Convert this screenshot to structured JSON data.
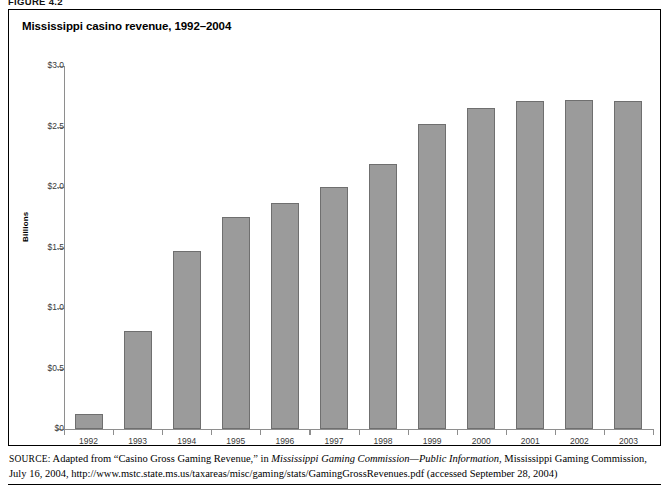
{
  "figure": {
    "label": "FIGURE 4.2"
  },
  "chart_data": {
    "type": "bar",
    "title": "Mississippi casino revenue, 1992–2004",
    "xlabel": "",
    "ylabel": "Billions",
    "categories": [
      "1992",
      "1993",
      "1994",
      "1995",
      "1996",
      "1997",
      "1998",
      "1999",
      "2000",
      "2001",
      "2002",
      "2003"
    ],
    "values": [
      0.12,
      0.81,
      1.47,
      1.75,
      1.87,
      2.0,
      2.19,
      2.52,
      2.65,
      2.71,
      2.72,
      2.71
    ],
    "ylim": [
      0,
      3.0
    ],
    "ytick_values": [
      0,
      0.5,
      1.0,
      1.5,
      2.0,
      2.5,
      3.0
    ],
    "ytick_labels": [
      "$0",
      "$0.5",
      "$1.0",
      "$1.5",
      "$2.0",
      "$2.5",
      "$3.0"
    ],
    "grid": false,
    "legend": "none",
    "bar_color": "#9b9b9b",
    "bar_edge_color": "#6f6f6f",
    "axis_color": "#8e8e8e",
    "plot_background": "#ffffff"
  },
  "source": {
    "kicker": "SOURCE:",
    "line1_pre": " Adapted from “Casino Gross Gaming Revenue,” in ",
    "line1_italic": "Mississippi Gaming Commission—Public Information",
    "line1_post": ", Mississippi Gaming Commission,",
    "line2": "July 16, 2004, http://www.mstc.state.ms.us/taxareas/misc/gaming/stats/GamingGrossRevenues.pdf (accessed September 28, 2004)"
  }
}
